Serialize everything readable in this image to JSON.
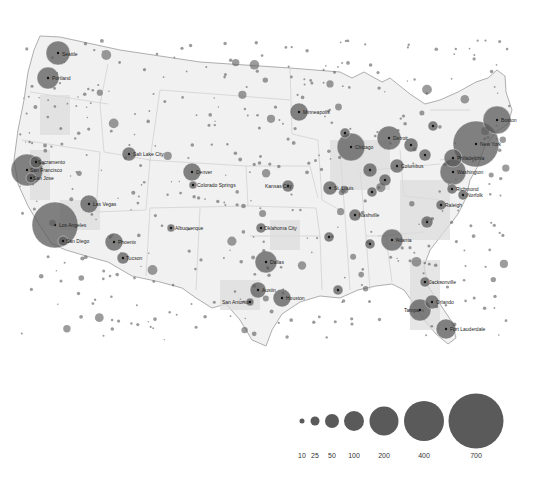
{
  "map": {
    "type": "proportional-symbol",
    "region": "Contiguous United States",
    "bubble_color": "#5a5a5a",
    "land_color": "#f0f0f0",
    "border_color": "#9a9a9a",
    "cities": [
      {
        "name": "Seattle",
        "x": 58,
        "y": 53,
        "r": 12
      },
      {
        "name": "Portland",
        "x": 48,
        "y": 78,
        "r": 11
      },
      {
        "name": "Sacramento",
        "x": 36,
        "y": 162,
        "r": 6
      },
      {
        "name": "San Francisco",
        "x": 27,
        "y": 170,
        "r": 16
      },
      {
        "name": "San Jose",
        "x": 31,
        "y": 178,
        "r": 5
      },
      {
        "name": "Las Vegas",
        "x": 89,
        "y": 204,
        "r": 9
      },
      {
        "name": "Los Angeles",
        "x": 55,
        "y": 225,
        "r": 23
      },
      {
        "name": "San Diego",
        "x": 63,
        "y": 241,
        "r": 5
      },
      {
        "name": "Phoenix",
        "x": 114,
        "y": 242,
        "r": 9
      },
      {
        "name": "Tucson",
        "x": 123,
        "y": 258,
        "r": 6
      },
      {
        "name": "Salt Lake City",
        "x": 129,
        "y": 154,
        "r": 7
      },
      {
        "name": "Denver",
        "x": 192,
        "y": 172,
        "r": 9
      },
      {
        "name": "Colorado Springs",
        "x": 193,
        "y": 185,
        "r": 4
      },
      {
        "name": "Albuquerque",
        "x": 171,
        "y": 228,
        "r": 4
      },
      {
        "name": "Minneapolis",
        "x": 299,
        "y": 112,
        "r": 9
      },
      {
        "name": "Kansas City",
        "x": 288,
        "y": 186,
        "r": 6
      },
      {
        "name": "Oklahoma City",
        "x": 261,
        "y": 228,
        "r": 5
      },
      {
        "name": "Dallas",
        "x": 266,
        "y": 262,
        "r": 11
      },
      {
        "name": "Austin",
        "x": 258,
        "y": 290,
        "r": 8
      },
      {
        "name": "San Antonio",
        "x": 250,
        "y": 302,
        "r": 4
      },
      {
        "name": "Houston",
        "x": 282,
        "y": 298,
        "r": 9
      },
      {
        "name": "Chicago",
        "x": 351,
        "y": 147,
        "r": 14
      },
      {
        "name": "Detroit",
        "x": 389,
        "y": 138,
        "r": 12
      },
      {
        "name": "Cleveland",
        "x": 411,
        "y": 145,
        "r": 7
      },
      {
        "name": "Columbus",
        "x": 397,
        "y": 166,
        "r": 7
      },
      {
        "name": "Indianapolis",
        "x": 370,
        "y": 170,
        "r": 7
      },
      {
        "name": "Cincinnati",
        "x": 385,
        "y": 180,
        "r": 6
      },
      {
        "name": "St. Louis",
        "x": 330,
        "y": 188,
        "r": 7
      },
      {
        "name": "Nashville",
        "x": 355,
        "y": 215,
        "r": 6
      },
      {
        "name": "Atlanta",
        "x": 392,
        "y": 240,
        "r": 11
      },
      {
        "name": "Charlotte",
        "x": 427,
        "y": 222,
        "r": 6
      },
      {
        "name": "Pittsburgh",
        "x": 425,
        "y": 155,
        "r": 6
      },
      {
        "name": "Philadelphia",
        "x": 453,
        "y": 158,
        "r": 9
      },
      {
        "name": "Washington",
        "x": 453,
        "y": 172,
        "r": 13
      },
      {
        "name": "New York",
        "x": 476,
        "y": 144,
        "r": 23
      },
      {
        "name": "Boston",
        "x": 497,
        "y": 120,
        "r": 14
      },
      {
        "name": "Richmond",
        "x": 452,
        "y": 189,
        "r": 5
      },
      {
        "name": "Norfolk",
        "x": 463,
        "y": 195,
        "r": 5
      },
      {
        "name": "Raleigh",
        "x": 441,
        "y": 205,
        "r": 5
      },
      {
        "name": "Jacksonville",
        "x": 425,
        "y": 282,
        "r": 5
      },
      {
        "name": "Orlando",
        "x": 432,
        "y": 302,
        "r": 7
      },
      {
        "name": "Tampa",
        "x": 420,
        "y": 310,
        "r": 11
      },
      {
        "name": "Fort Lauderdale",
        "x": 446,
        "y": 329,
        "r": 10
      },
      {
        "name": "New Orleans",
        "x": 338,
        "y": 290,
        "r": 5
      },
      {
        "name": "Memphis",
        "x": 329,
        "y": 237,
        "r": 5
      },
      {
        "name": "Buffalo",
        "x": 433,
        "y": 126,
        "r": 5
      },
      {
        "name": "Milwaukee",
        "x": 345,
        "y": 133,
        "r": 5
      },
      {
        "name": "Louisville",
        "x": 372,
        "y": 192,
        "r": 5
      },
      {
        "name": "Birmingham",
        "x": 370,
        "y": 244,
        "r": 5
      }
    ],
    "labels": [
      {
        "text": "Seattle",
        "x": 62,
        "y": 56
      },
      {
        "text": "Portland",
        "x": 52,
        "y": 80
      },
      {
        "text": "Sacramento",
        "x": 38,
        "y": 164
      },
      {
        "text": "San Francisco",
        "x": 30,
        "y": 172
      },
      {
        "text": "San Jose",
        "x": 33,
        "y": 180
      },
      {
        "text": "Las Vegas",
        "x": 93,
        "y": 206
      },
      {
        "text": "Los Angeles",
        "x": 59,
        "y": 227
      },
      {
        "text": "San Diego",
        "x": 66,
        "y": 243
      },
      {
        "text": "Phoenix",
        "x": 118,
        "y": 244
      },
      {
        "text": "Tucson",
        "x": 126,
        "y": 260
      },
      {
        "text": "Salt Lake City",
        "x": 133,
        "y": 156
      },
      {
        "text": "Denver",
        "x": 196,
        "y": 174
      },
      {
        "text": "Colorado Springs",
        "x": 197,
        "y": 187
      },
      {
        "text": "Albuquerque",
        "x": 175,
        "y": 230
      },
      {
        "text": "Minneapolis",
        "x": 303,
        "y": 114
      },
      {
        "text": "Kansas City",
        "x": 265,
        "y": 188
      },
      {
        "text": "Oklahoma City",
        "x": 264,
        "y": 230
      },
      {
        "text": "Dallas",
        "x": 270,
        "y": 264
      },
      {
        "text": "Austin",
        "x": 262,
        "y": 292
      },
      {
        "text": "San Antonio",
        "x": 222,
        "y": 304
      },
      {
        "text": "Houston",
        "x": 286,
        "y": 300
      },
      {
        "text": "Chicago",
        "x": 355,
        "y": 149
      },
      {
        "text": "Detroit",
        "x": 393,
        "y": 140
      },
      {
        "text": "Columbus",
        "x": 401,
        "y": 168
      },
      {
        "text": "St. Louis",
        "x": 334,
        "y": 190
      },
      {
        "text": "Nashville",
        "x": 359,
        "y": 217
      },
      {
        "text": "Atlanta",
        "x": 396,
        "y": 242
      },
      {
        "text": "Philadelphia",
        "x": 457,
        "y": 160
      },
      {
        "text": "Washington",
        "x": 457,
        "y": 174
      },
      {
        "text": "New York",
        "x": 480,
        "y": 146
      },
      {
        "text": "Boston",
        "x": 501,
        "y": 122
      },
      {
        "text": "Richmond",
        "x": 456,
        "y": 191
      },
      {
        "text": "Norfolk",
        "x": 467,
        "y": 197
      },
      {
        "text": "Raleigh",
        "x": 445,
        "y": 207
      },
      {
        "text": "Jacksonville",
        "x": 429,
        "y": 284
      },
      {
        "text": "Orlando",
        "x": 436,
        "y": 304
      },
      {
        "text": "Tampa",
        "x": 404,
        "y": 312
      },
      {
        "text": "Fort Lauderdale",
        "x": 450,
        "y": 331
      }
    ]
  },
  "legend": {
    "sizes": [
      {
        "label": "10",
        "value": 10,
        "cx": 302,
        "r": 2.5
      },
      {
        "label": "25",
        "value": 25,
        "cx": 315,
        "r": 4.5
      },
      {
        "label": "50",
        "value": 50,
        "cx": 332,
        "r": 7
      },
      {
        "label": "100",
        "value": 100,
        "cx": 354,
        "r": 10
      },
      {
        "label": "200",
        "value": 200,
        "cx": 384,
        "r": 14.5
      },
      {
        "label": "400",
        "value": 400,
        "cx": 424,
        "r": 20
      },
      {
        "label": "700",
        "value": 700,
        "cx": 476,
        "r": 27.5
      }
    ],
    "circle_cy": 421,
    "label_y": 458
  }
}
